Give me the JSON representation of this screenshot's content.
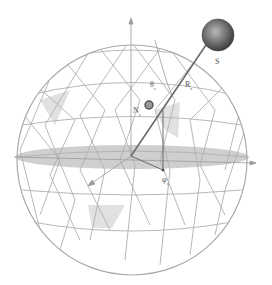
{
  "figure": {
    "labels": {
      "source": "S",
      "theta": "θ",
      "theta_sub": "s",
      "range": "R",
      "range_sub": "s",
      "normal": "N",
      "normal_sub": "s",
      "phi": "φ",
      "phi_sub": "s"
    },
    "colors": {
      "mesh": "#b5b5b5",
      "equator_plane": "#bdbdbd",
      "source_sphere": "#6b6b6b",
      "vector": "#666666",
      "highlight_facet": "#d8d8d8"
    }
  }
}
